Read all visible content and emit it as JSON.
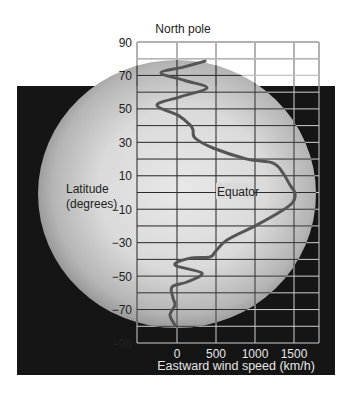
{
  "chart_data": {
    "type": "line",
    "title": "North pole",
    "xlabel": "Eastward wind speed (km/h)",
    "ylabel": "Latitude (degrees)",
    "xlim": [
      -500,
      1820
    ],
    "ylim": [
      -90,
      90
    ],
    "x_ticks": [
      0,
      500,
      1000,
      1500
    ],
    "x_tick_labels": [
      "0",
      "500",
      "1000",
      "1500"
    ],
    "y_ticks": [
      90,
      70,
      50,
      30,
      10,
      -10,
      -30,
      -50,
      -70,
      -90
    ],
    "y_tick_labels": [
      "90",
      "70",
      "50",
      "30",
      "10",
      "−10",
      "−30",
      "−50",
      "−70",
      "−90"
    ],
    "grid": true,
    "grid_x_step": 500,
    "grid_y_step": 10,
    "annotations": [
      {
        "text": "Equator",
        "x": 700,
        "y": 0
      },
      {
        "text": "North pole",
        "position": "top"
      }
    ],
    "series": [
      {
        "name": "Eastward wind speed",
        "color": "#555555",
        "points": [
          {
            "lat": 78.6,
            "speed": 360
          },
          {
            "lat": 75,
            "speed": 80
          },
          {
            "lat": 71.5,
            "speed": -205
          },
          {
            "lat": 67,
            "speed": 100
          },
          {
            "lat": 62.5,
            "speed": 385
          },
          {
            "lat": 57.5,
            "speed": 60
          },
          {
            "lat": 52.3,
            "speed": -256
          },
          {
            "lat": 46,
            "speed": 20
          },
          {
            "lat": 40.4,
            "speed": 167
          },
          {
            "lat": 37.4,
            "speed": 205
          },
          {
            "lat": 32.6,
            "speed": 231
          },
          {
            "lat": 26.6,
            "speed": 462
          },
          {
            "lat": 20,
            "speed": 897
          },
          {
            "lat": 17.6,
            "speed": 1231
          },
          {
            "lat": 11.6,
            "speed": 1359
          },
          {
            "lat": 4.5,
            "speed": 1449
          },
          {
            "lat": -0.3,
            "speed": 1513
          },
          {
            "lat": -5.7,
            "speed": 1487
          },
          {
            "lat": -10.5,
            "speed": 1359
          },
          {
            "lat": -19.4,
            "speed": 1026
          },
          {
            "lat": -28.4,
            "speed": 641
          },
          {
            "lat": -35.6,
            "speed": 487
          },
          {
            "lat": -38.6,
            "speed": 423
          },
          {
            "lat": -39.2,
            "speed": 167
          },
          {
            "lat": -43.4,
            "speed": -26
          },
          {
            "lat": -48.2,
            "speed": 321
          },
          {
            "lat": -53.5,
            "speed": 128
          },
          {
            "lat": -56.5,
            "speed": -64
          },
          {
            "lat": -63.1,
            "speed": -51
          },
          {
            "lat": -67.3,
            "speed": -26
          },
          {
            "lat": -73.3,
            "speed": -90
          },
          {
            "lat": -79.3,
            "speed": -26
          }
        ]
      }
    ]
  },
  "labels": {
    "north_pole": "North pole",
    "ylabel_line1": "Latitude",
    "ylabel_line2": "(degrees)",
    "xlabel": "Eastward wind speed (km/h)",
    "equator": "Equator"
  },
  "colors": {
    "background": "#ffffff",
    "space": "#151515",
    "globe_light": "#e4e4e4",
    "globe_dark": "#8a8a8a",
    "grid_on_globe": "#2b2b2b",
    "grid_on_space": "#d8d8d8",
    "curve": "#555555"
  }
}
